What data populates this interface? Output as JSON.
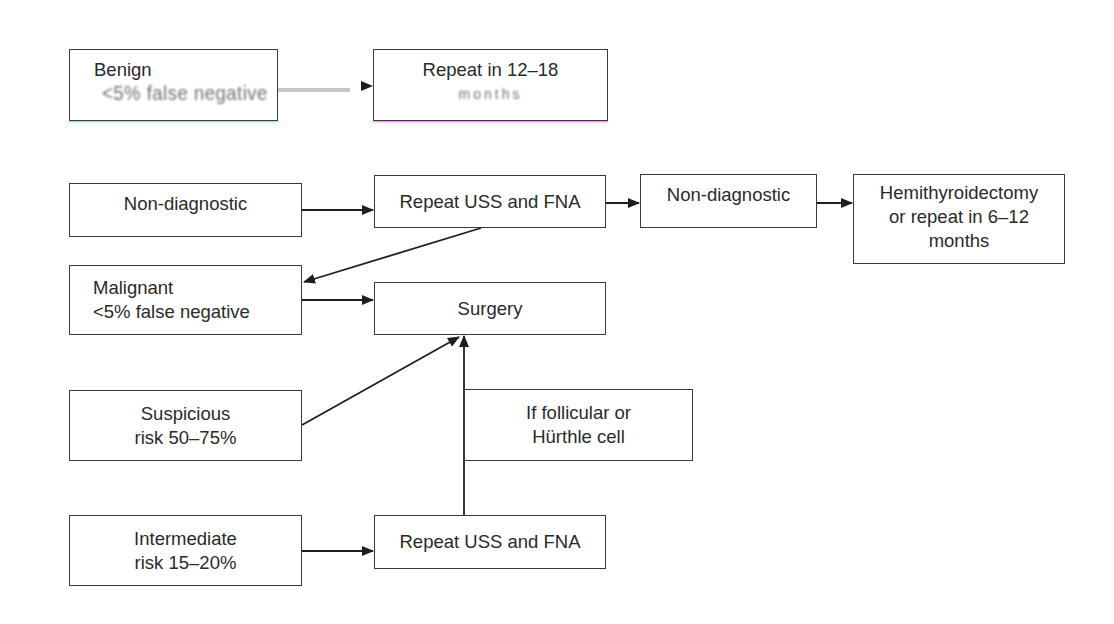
{
  "diagram": {
    "type": "flowchart",
    "nodes": {
      "benign": {
        "lines": [
          "Benign",
          "<5% false negative"
        ],
        "second_line_blurred": true
      },
      "repeat_12_18": {
        "lines": [
          "Repeat in 12–18",
          "months"
        ],
        "second_line_blurred": true
      },
      "non_diagnostic": {
        "lines": [
          "Non-diagnostic"
        ]
      },
      "repeat_uss_fna_1": {
        "lines": [
          "Repeat USS and FNA"
        ]
      },
      "non_diagnostic_2": {
        "lines": [
          "Non-diagnostic"
        ]
      },
      "hemithyroidectomy": {
        "lines": [
          "Hemithyroidectomy",
          "or repeat in 6–12",
          "months"
        ]
      },
      "malignant": {
        "lines": [
          "Malignant",
          "<5% false negative"
        ]
      },
      "surgery": {
        "lines": [
          "Surgery"
        ]
      },
      "suspicious": {
        "lines": [
          "Suspicious",
          "risk 50–75%"
        ]
      },
      "follicular": {
        "lines": [
          "If follicular or",
          "Hürthle cell"
        ]
      },
      "intermediate": {
        "lines": [
          "Intermediate",
          "risk 15–20%"
        ]
      },
      "repeat_uss_fna_2": {
        "lines": [
          "Repeat USS and FNA"
        ]
      }
    },
    "edges": [
      {
        "from": "benign",
        "to": "repeat_12_18"
      },
      {
        "from": "non_diagnostic",
        "to": "repeat_uss_fna_1"
      },
      {
        "from": "repeat_uss_fna_1",
        "to": "non_diagnostic_2"
      },
      {
        "from": "non_diagnostic_2",
        "to": "hemithyroidectomy"
      },
      {
        "from": "repeat_uss_fna_1",
        "to": "malignant"
      },
      {
        "from": "malignant",
        "to": "surgery"
      },
      {
        "from": "suspicious",
        "to": "surgery"
      },
      {
        "from": "repeat_uss_fna_2",
        "to": "surgery",
        "label_node": "follicular"
      },
      {
        "from": "intermediate",
        "to": "repeat_uss_fna_2"
      }
    ],
    "colors": {
      "stroke": "#2b2b2b",
      "text": "#2a2a2a",
      "background": "#ffffff"
    }
  }
}
